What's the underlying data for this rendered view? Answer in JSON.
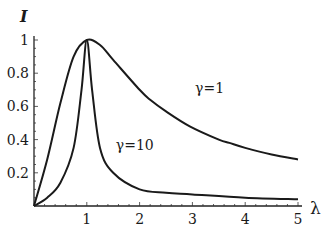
{
  "chart_data": {
    "type": "line",
    "title": "",
    "xlabel": "λ",
    "ylabel": "I",
    "xlim": [
      0,
      5
    ],
    "ylim": [
      0,
      1
    ],
    "x_ticks": [
      "1",
      "2",
      "3",
      "4",
      "5"
    ],
    "y_ticks": [
      "0.2",
      "0.4",
      "0.6",
      "0.8",
      "1"
    ],
    "grid": false,
    "legend": "inline annotations",
    "annotations": [
      {
        "text": "γ=1",
        "x": 3.05,
        "y": 0.71
      },
      {
        "text": "γ=10",
        "x": 1.55,
        "y": 0.37
      }
    ],
    "series": [
      {
        "name": "γ=1",
        "x": [
          0,
          0.25,
          0.5,
          0.75,
          1.0,
          1.25,
          1.5,
          2.0,
          2.2,
          2.5,
          2.95,
          3.5,
          3.7,
          4.0,
          4.5,
          5.0
        ],
        "values": [
          0,
          0.28,
          0.62,
          0.9,
          1.0,
          0.97,
          0.88,
          0.7,
          0.64,
          0.57,
          0.48,
          0.4,
          0.38,
          0.35,
          0.31,
          0.28
        ]
      },
      {
        "name": "γ=10",
        "x": [
          0,
          0.25,
          0.5,
          0.75,
          0.9,
          1.0,
          1.1,
          1.25,
          1.5,
          2.0,
          2.5,
          3.0,
          4.0,
          5.0
        ],
        "values": [
          0,
          0.05,
          0.14,
          0.35,
          0.7,
          1.0,
          0.7,
          0.35,
          0.2,
          0.1,
          0.08,
          0.07,
          0.05,
          0.04
        ]
      }
    ]
  },
  "axes": {
    "y_label": "I",
    "x_label": "λ"
  }
}
